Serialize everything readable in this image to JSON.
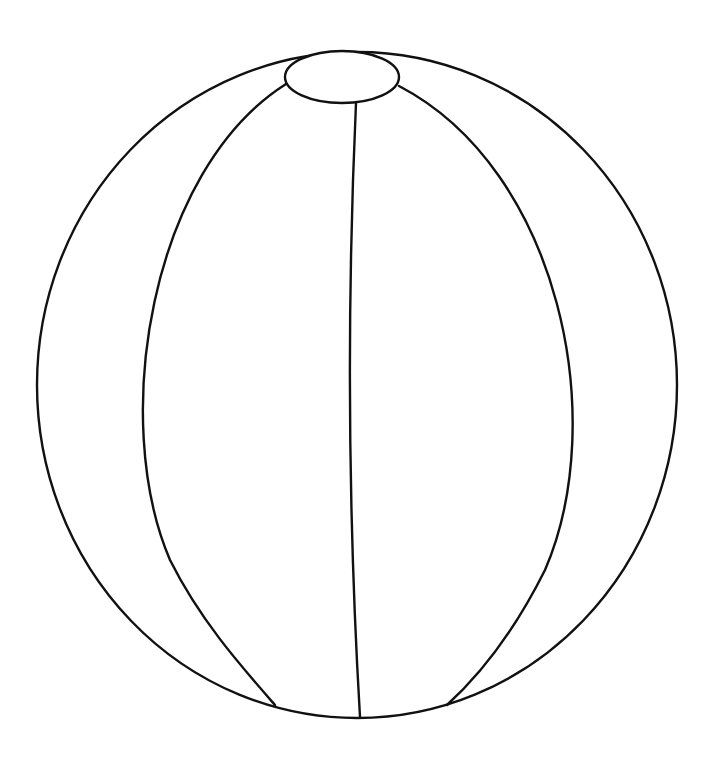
{
  "drawing": {
    "subject": "beach ball outline",
    "stroke_color": "#111111",
    "background_color": "#ffffff",
    "outer": {
      "cx": 357,
      "cy": 385,
      "rx": 320,
      "ry": 333
    },
    "top_cap": {
      "cx": 342,
      "cy": 77,
      "rx": 57,
      "ry": 26
    },
    "seams": [
      {
        "name": "left-outer-seam",
        "d": "M286 84 C150 170 110 420 170 560 C200 620 240 665 275 705"
      },
      {
        "name": "center-seam",
        "d": "M356 103 C348 280 346 480 360 717"
      },
      {
        "name": "right-outer-seam",
        "d": "M399 86 C560 170 610 420 545 570 C515 630 480 675 447 705"
      }
    ]
  }
}
